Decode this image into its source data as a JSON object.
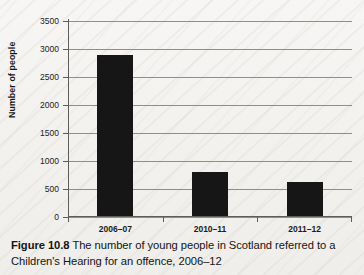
{
  "figure": {
    "caption_label": "Figure 10.8",
    "caption_text": " The number of young people in Scotland referred to a Children's Hearing for an offence, 2006–12"
  },
  "chart_data": {
    "type": "bar",
    "title": "",
    "categories": [
      "2006–07",
      "2010–11",
      "2011–12"
    ],
    "values": [
      2900,
      800,
      620
    ],
    "series": [
      {
        "name": "Number of people",
        "values": [
          2900,
          800,
          620
        ]
      }
    ],
    "xlabel": "",
    "ylabel": "Number of people",
    "ylim": [
      0,
      3500
    ],
    "ytick_step": 500,
    "yticks": [
      0,
      500,
      1000,
      1500,
      2000,
      2500,
      3000,
      3500
    ],
    "ytick_labels": [
      "0",
      "500",
      "1000",
      "1500",
      "2000",
      "2500",
      "3000",
      "3500"
    ],
    "grid": "horizontal",
    "legend": "none",
    "bar_color": "#161616",
    "gridline_color": "#8e8e8e",
    "axis_color": "#5d5d5d",
    "background_color": "#f4f3f1"
  }
}
